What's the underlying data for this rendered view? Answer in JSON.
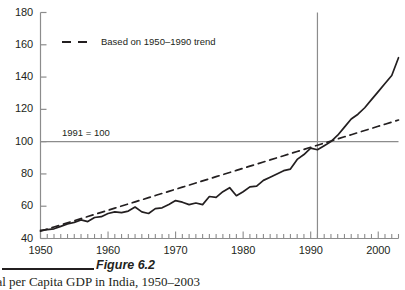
{
  "figure": {
    "number_label": "Figure 6.2",
    "caption": "Real per Capita GDP in India, 1950–2003"
  },
  "annotations": {
    "base_note": "1991 = 100",
    "legend_label": "Based on 1950–1990 trend"
  },
  "colors": {
    "line": "#231f20",
    "axis": "#8c8c8c",
    "reference": "#8c8c8c",
    "text": "#231f20",
    "background": "#ffffff"
  },
  "chart_data": {
    "type": "line",
    "title": "",
    "subtitle": "",
    "xlabel": "",
    "ylabel": "",
    "xlim": [
      1950,
      2003
    ],
    "ylim": [
      40,
      180
    ],
    "ytick_labels": [
      "40",
      "60",
      "80",
      "100",
      "120",
      "140",
      "160",
      "180"
    ],
    "yticks": [
      40,
      60,
      80,
      100,
      120,
      140,
      160,
      180
    ],
    "ytick_step": 20,
    "xtick_labels": [
      "1950",
      "1960",
      "1970",
      "1980",
      "1990",
      "2000"
    ],
    "xticks": [
      1950,
      1960,
      1970,
      1980,
      1990,
      2000
    ],
    "minor_xtick_interval": 1,
    "grid": false,
    "legend_position": "top-left-inside",
    "reference_lines": [
      {
        "name": "base-year-horizontal",
        "orientation": "horizontal",
        "value": 100
      },
      {
        "name": "base-year-vertical",
        "orientation": "vertical",
        "value": 1991
      }
    ],
    "x": [
      1950,
      1951,
      1952,
      1953,
      1954,
      1955,
      1956,
      1957,
      1958,
      1959,
      1960,
      1961,
      1962,
      1963,
      1964,
      1965,
      1966,
      1967,
      1968,
      1969,
      1970,
      1971,
      1972,
      1973,
      1974,
      1975,
      1976,
      1977,
      1978,
      1979,
      1980,
      1981,
      1982,
      1983,
      1984,
      1985,
      1986,
      1987,
      1988,
      1989,
      1990,
      1991,
      1992,
      1993,
      1994,
      1995,
      1996,
      1997,
      1998,
      1999,
      2000,
      2001,
      2002,
      2003
    ],
    "series": [
      {
        "name": "Real per capita GDP index",
        "style": "solid",
        "values": [
          45.0,
          45.5,
          46.0,
          47.5,
          49.0,
          50.0,
          51.5,
          50.5,
          53.0,
          53.5,
          55.5,
          56.5,
          56.0,
          57.0,
          59.5,
          56.5,
          55.5,
          58.5,
          59.0,
          61.0,
          63.5,
          62.5,
          61.0,
          62.0,
          61.0,
          66.0,
          65.5,
          69.0,
          71.5,
          66.5,
          69.0,
          72.0,
          72.5,
          76.0,
          78.0,
          80.0,
          82.0,
          83.0,
          89.0,
          92.0,
          96.0,
          95.0,
          97.5,
          100.0,
          104.0,
          109.0,
          114.0,
          117.0,
          121.0,
          126.0,
          131.0,
          136.0,
          141.0,
          152.0
        ]
      },
      {
        "name": "Based on 1950–1990 trend",
        "style": "dashed",
        "values": [
          44.5,
          45.8,
          47.1,
          48.4,
          49.7,
          51.0,
          52.3,
          53.6,
          54.9,
          56.2,
          57.5,
          58.8,
          60.1,
          61.4,
          62.7,
          64.0,
          65.3,
          66.6,
          67.9,
          69.2,
          70.5,
          71.8,
          73.1,
          74.4,
          75.7,
          77.0,
          78.3,
          79.6,
          80.9,
          82.2,
          83.5,
          84.8,
          86.1,
          87.4,
          88.7,
          90.0,
          91.3,
          92.6,
          93.9,
          95.2,
          96.5,
          97.8,
          99.1,
          100.4,
          101.7,
          103.0,
          104.3,
          105.6,
          106.9,
          108.2,
          109.5,
          110.8,
          112.1,
          113.4
        ]
      }
    ]
  }
}
